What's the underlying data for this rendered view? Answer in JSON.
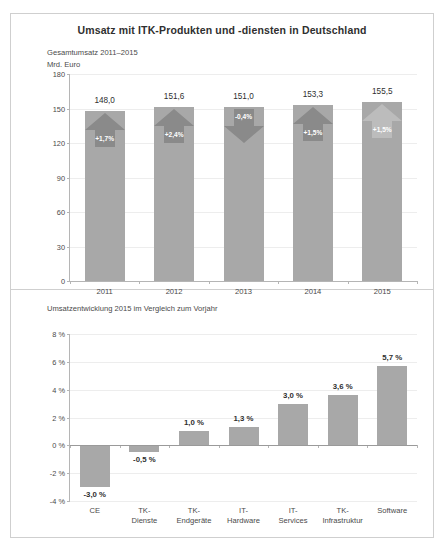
{
  "figure": {
    "title": "Umsatz mit ITK-Produkten und -diensten in Deutschland",
    "panel_top_subtitle": "Gesamtumsatz 2011–2015",
    "panel_top_unit": "Mrd. Euro",
    "panel_bottom_subtitle": "Umsatzentwicklung 2015 im Vergleich zum Vorjahr",
    "colors": {
      "bar": "#a8a8a8",
      "arrow": "#8a8a8a",
      "arrow_light": "#bcbcbc",
      "axis": "#b5b5b5",
      "grid": "#ededed",
      "frame": "#cfcfcf",
      "text": "#3a3a3a"
    }
  },
  "chart_data": [
    {
      "type": "bar",
      "title": "Gesamtumsatz 2011–2015",
      "xlabel": "",
      "ylabel": "Mrd. Euro",
      "ylim": [
        0,
        180
      ],
      "grid": true,
      "legend": "none",
      "yticks": [
        "0",
        "30",
        "60",
        "90",
        "120",
        "150",
        "180"
      ],
      "ytick_values": [
        0,
        30,
        60,
        90,
        120,
        150,
        180
      ],
      "categories": [
        "2011",
        "2012",
        "2013",
        "2014",
        "2015"
      ],
      "values": [
        148.0,
        151.6,
        151.0,
        153.3,
        155.5
      ],
      "value_labels": [
        "148,0",
        "151,6",
        "151,0",
        "153,3",
        "155,5"
      ],
      "annotations": [
        {
          "label": "+1,7%",
          "direction": "up",
          "value": 1.7,
          "style": "solid"
        },
        {
          "label": "+2,4%",
          "direction": "up",
          "value": 2.4,
          "style": "solid"
        },
        {
          "label": "-0,4%",
          "direction": "down",
          "value": -0.4,
          "style": "solid"
        },
        {
          "label": "+1,5%",
          "direction": "up",
          "value": 1.5,
          "style": "solid"
        },
        {
          "label": "+1,5%",
          "direction": "up",
          "value": 1.5,
          "style": "light"
        }
      ]
    },
    {
      "type": "bar",
      "title": "Umsatzentwicklung 2015 im Vergleich zum Vorjahr",
      "xlabel": "",
      "ylabel": "",
      "ylim": [
        -4,
        8
      ],
      "grid": true,
      "legend": "none",
      "yticks": [
        "8 %",
        "6 %",
        "4 %",
        "2 %",
        "0 %",
        "-2 %",
        "-4 %"
      ],
      "ytick_values": [
        8,
        6,
        4,
        2,
        0,
        -2,
        -4
      ],
      "categories": [
        "CE",
        "TK-\nDienste",
        "TK-\nEndgeräte",
        "IT-\nHardware",
        "IT-\nServices",
        "TK-\nInfrastruktur",
        "Software"
      ],
      "values": [
        -3.0,
        -0.5,
        1.0,
        1.3,
        3.0,
        3.6,
        5.7
      ],
      "value_labels": [
        "-3,0 %",
        "-0,5 %",
        "1,0 %",
        "1,3 %",
        "3,0 %",
        "3,6 %",
        "5,7 %"
      ]
    }
  ]
}
